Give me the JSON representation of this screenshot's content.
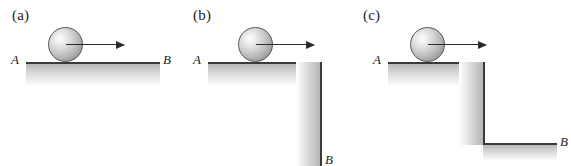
{
  "figure": {
    "background_color": "#ffffff",
    "line_color": "#3a3a3a",
    "ball_color_light": "#fdfdfd",
    "ball_color_dark": "#868686",
    "arrow_color": "#2b2b2b"
  },
  "panels": [
    {
      "id": "a",
      "label": "(a)",
      "start_label": "A",
      "end_label": "B",
      "surface_type": "flat",
      "ball": {
        "diameter": 34,
        "center_x": 65,
        "center_y": 44
      },
      "arrow": {
        "from_x": 67,
        "to_x": 125,
        "y": 44,
        "direction": "right"
      }
    },
    {
      "id": "b",
      "label": "(b)",
      "start_label": "A",
      "end_label": "B",
      "surface_type": "cliff-drop",
      "ball": {
        "diameter": 34,
        "center_x": 65,
        "center_y": 44
      },
      "arrow": {
        "from_x": 67,
        "to_x": 125,
        "y": 44,
        "direction": "right"
      }
    },
    {
      "id": "c",
      "label": "(c)",
      "start_label": "A",
      "end_label": "B",
      "surface_type": "step-down",
      "ball": {
        "diameter": 34,
        "center_x": 65,
        "center_y": 44
      },
      "arrow": {
        "from_x": 67,
        "to_x": 125,
        "y": 44,
        "direction": "right"
      }
    }
  ]
}
